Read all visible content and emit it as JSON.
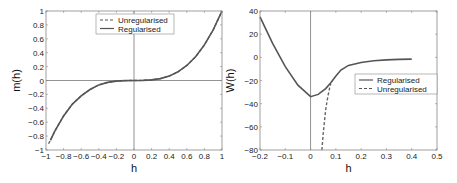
{
  "chart_data": [
    {
      "type": "line",
      "title": "",
      "xlabel": "h",
      "ylabel": "m(h)",
      "xlim": [
        -1,
        1
      ],
      "ylim": [
        -1,
        1
      ],
      "xticks": [
        "-1",
        "-0.8",
        "-0.6",
        "-0.4",
        "-0.2",
        "0",
        "0.2",
        "0.4",
        "0.6",
        "0.8",
        "1"
      ],
      "yticks": [
        "-1",
        "-0.8",
        "-0.6",
        "-0.4",
        "-0.2",
        "0",
        "0.2",
        "0.4",
        "0.6",
        "0.8",
        "1"
      ],
      "grid": false,
      "reference_lines": {
        "x": 0,
        "y": 0
      },
      "legend": {
        "position": "upper center",
        "entries": [
          {
            "label": "Unregularised",
            "style": "dashed"
          },
          {
            "label": "Regularised",
            "style": "solid"
          }
        ]
      },
      "series": [
        {
          "name": "Unregularised",
          "style": "dashed",
          "x": [
            -0.97,
            -0.9,
            -0.8,
            -0.7,
            -0.6,
            -0.5,
            -0.4,
            -0.3,
            -0.2,
            -0.1,
            0,
            0.1,
            0.2,
            0.3,
            0.4,
            0.5,
            0.6,
            0.7,
            0.8,
            0.9,
            1.0
          ],
          "y": [
            -0.91,
            -0.73,
            -0.51,
            -0.34,
            -0.22,
            -0.13,
            -0.064,
            -0.027,
            -0.008,
            -0.001,
            0,
            0.001,
            0.008,
            0.027,
            0.064,
            0.125,
            0.216,
            0.343,
            0.512,
            0.729,
            1.0
          ]
        },
        {
          "name": "Regularised",
          "style": "solid",
          "x": [
            -0.95,
            -0.9,
            -0.8,
            -0.7,
            -0.6,
            -0.5,
            -0.4,
            -0.3,
            -0.2,
            -0.1,
            0,
            0.1,
            0.2,
            0.3,
            0.4,
            0.5,
            0.6,
            0.7,
            0.8,
            0.9,
            1.0
          ],
          "y": [
            -0.86,
            -0.73,
            -0.51,
            -0.34,
            -0.22,
            -0.13,
            -0.064,
            -0.027,
            -0.008,
            -0.001,
            0,
            0.001,
            0.008,
            0.027,
            0.064,
            0.125,
            0.216,
            0.343,
            0.512,
            0.729,
            1.0
          ]
        }
      ]
    },
    {
      "type": "line",
      "title": "",
      "xlabel": "h",
      "ylabel": "W(h)",
      "xlim": [
        -0.2,
        0.5
      ],
      "ylim": [
        -80,
        40
      ],
      "xticks": [
        "-0.2",
        "-0.1",
        "0",
        "0.1",
        "0.2",
        "0.3",
        "0.4",
        "0.5"
      ],
      "yticks": [
        "-80",
        "-60",
        "-40",
        "-20",
        "0",
        "20",
        "40"
      ],
      "grid": false,
      "reference_lines": {
        "x": 0
      },
      "legend": {
        "position": "center right",
        "entries": [
          {
            "label": "Regularised",
            "style": "solid"
          },
          {
            "label": "Unregularised",
            "style": "dashed"
          }
        ]
      },
      "series": [
        {
          "name": "Regularised",
          "style": "solid",
          "x": [
            -0.2,
            -0.15,
            -0.1,
            -0.05,
            0,
            0.03,
            0.06,
            0.08,
            0.1,
            0.12,
            0.15,
            0.2,
            0.25,
            0.3,
            0.35,
            0.4
          ],
          "y": [
            35,
            12,
            -8,
            -24,
            -34,
            -32,
            -27,
            -22,
            -16,
            -11,
            -7,
            -4.5,
            -3,
            -2.2,
            -1.8,
            -1.5
          ]
        },
        {
          "name": "Unregularised",
          "style": "dashed",
          "x": [
            0.045,
            0.05,
            0.055,
            0.06,
            0.065,
            0.07,
            0.075,
            0.08
          ],
          "y": [
            -80,
            -66,
            -55,
            -45,
            -38,
            -32,
            -27,
            -23
          ]
        }
      ]
    }
  ]
}
